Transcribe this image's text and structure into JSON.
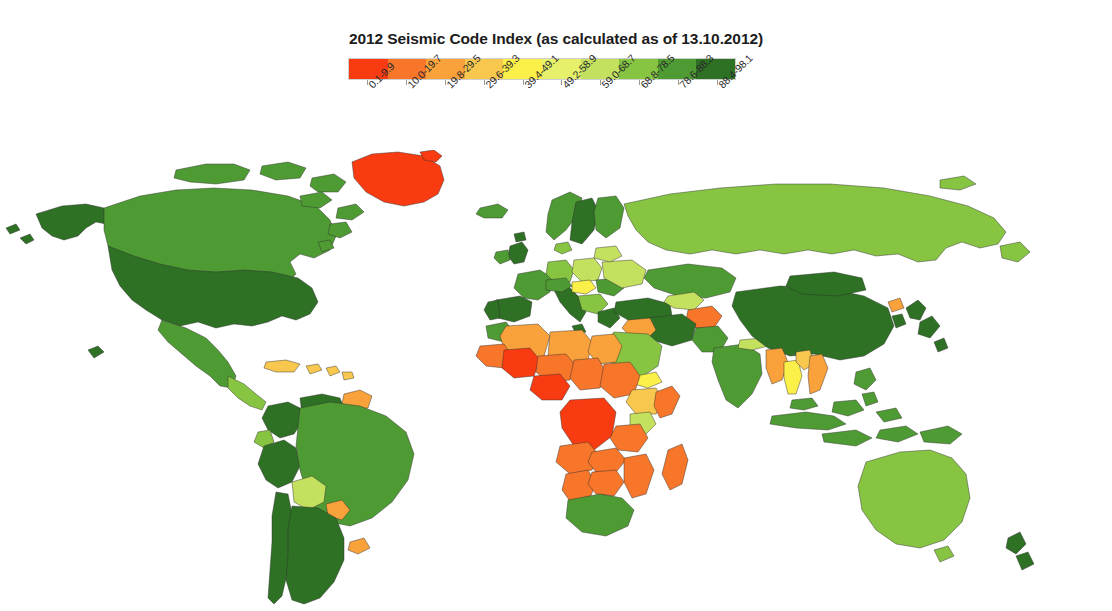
{
  "top_cutoff_text": "· · · · · · · · · · · · · · · · · · · · · · · · · · ·",
  "header": {
    "title": "2012 Seismic Code Index (as calculated as of 13.10.2012)"
  },
  "chart_data": {
    "type": "map",
    "subtype": "choropleth",
    "title": "2012 Seismic Code Index (as calculated as of 13.10.2012)",
    "xlabel": "",
    "ylabel": "",
    "grid": false,
    "legend_position": "top-center",
    "legend_orientation": "horizontal",
    "value_name": "Seismic Code Index",
    "value_range": [
      0.1,
      98.1
    ],
    "projection": "equirectangular-like world map",
    "bins": [
      {
        "label": "0.1-9.9",
        "min": 0.1,
        "max": 9.9,
        "color": "#f93b12"
      },
      {
        "label": "10.0-19.7",
        "min": 10.0,
        "max": 19.7,
        "color": "#f7762a"
      },
      {
        "label": "19.8-29.5",
        "min": 19.8,
        "max": 29.5,
        "color": "#f9a13a"
      },
      {
        "label": "29.6-39.3",
        "min": 29.6,
        "max": 39.3,
        "color": "#f8c84e"
      },
      {
        "label": "39.4-49.1",
        "min": 39.4,
        "max": 49.1,
        "color": "#fbef4a"
      },
      {
        "label": "49.2-58.9",
        "min": 49.2,
        "max": 58.9,
        "color": "#e6f06a"
      },
      {
        "label": "59.0-68.7",
        "min": 59.0,
        "max": 68.7,
        "color": "#c3e05e"
      },
      {
        "label": "68.8-78.5",
        "min": 68.8,
        "max": 78.5,
        "color": "#86c442"
      },
      {
        "label": "78.6-88.3",
        "min": 78.6,
        "max": 88.3,
        "color": "#4f9b33"
      },
      {
        "label": "88.4-98.1",
        "min": 88.4,
        "max": 98.1,
        "color": "#2e7024"
      }
    ],
    "regions": [
      {
        "name": "United States of America",
        "bin": "88.4-98.1",
        "color": "#2e7024"
      },
      {
        "name": "Canada",
        "bin": "78.6-88.3",
        "color": "#4f9b33"
      },
      {
        "name": "Alaska (USA)",
        "bin": "88.4-98.1",
        "color": "#2e7024"
      },
      {
        "name": "Greenland",
        "bin": "0.1-9.9",
        "color": "#f93b12"
      },
      {
        "name": "Mexico",
        "bin": "78.6-88.3",
        "color": "#4f9b33"
      },
      {
        "name": "Central America",
        "bin": "68.8-78.5",
        "color": "#86c442"
      },
      {
        "name": "Caribbean",
        "bin": "29.6-39.3",
        "color": "#f8c84e"
      },
      {
        "name": "Colombia",
        "bin": "88.4-98.1",
        "color": "#2e7024"
      },
      {
        "name": "Venezuela",
        "bin": "88.4-98.1",
        "color": "#2e7024"
      },
      {
        "name": "Guyana / Suriname",
        "bin": "19.8-29.5",
        "color": "#f9a13a"
      },
      {
        "name": "Ecuador",
        "bin": "68.8-78.5",
        "color": "#86c442"
      },
      {
        "name": "Peru",
        "bin": "88.4-98.1",
        "color": "#2e7024"
      },
      {
        "name": "Brazil",
        "bin": "78.6-88.3",
        "color": "#4f9b33"
      },
      {
        "name": "Bolivia",
        "bin": "59.0-68.7",
        "color": "#c3e05e"
      },
      {
        "name": "Paraguay",
        "bin": "19.8-29.5",
        "color": "#f9a13a"
      },
      {
        "name": "Uruguay",
        "bin": "19.8-29.5",
        "color": "#f9a13a"
      },
      {
        "name": "Chile",
        "bin": "88.4-98.1",
        "color": "#2e7024"
      },
      {
        "name": "Argentina",
        "bin": "88.4-98.1",
        "color": "#2e7024"
      },
      {
        "name": "Iceland",
        "bin": "78.6-88.3",
        "color": "#4f9b33"
      },
      {
        "name": "United Kingdom",
        "bin": "88.4-98.1",
        "color": "#2e7024"
      },
      {
        "name": "Ireland",
        "bin": "78.6-88.3",
        "color": "#4f9b33"
      },
      {
        "name": "Norway",
        "bin": "78.6-88.3",
        "color": "#4f9b33"
      },
      {
        "name": "Sweden",
        "bin": "88.4-98.1",
        "color": "#2e7024"
      },
      {
        "name": "Finland",
        "bin": "78.6-88.3",
        "color": "#4f9b33"
      },
      {
        "name": "Denmark",
        "bin": "68.8-78.5",
        "color": "#86c442"
      },
      {
        "name": "France",
        "bin": "78.6-88.3",
        "color": "#4f9b33"
      },
      {
        "name": "Spain",
        "bin": "88.4-98.1",
        "color": "#2e7024"
      },
      {
        "name": "Portugal",
        "bin": "88.4-98.1",
        "color": "#2e7024"
      },
      {
        "name": "Germany",
        "bin": "68.8-78.5",
        "color": "#86c442"
      },
      {
        "name": "Poland",
        "bin": "59.0-68.7",
        "color": "#c3e05e"
      },
      {
        "name": "Italy",
        "bin": "88.4-98.1",
        "color": "#2e7024"
      },
      {
        "name": "Austria / Switzerland",
        "bin": "78.6-88.3",
        "color": "#4f9b33"
      },
      {
        "name": "Hungary",
        "bin": "39.4-49.1",
        "color": "#fbef4a"
      },
      {
        "name": "Romania",
        "bin": "78.6-88.3",
        "color": "#4f9b33"
      },
      {
        "name": "Balkans",
        "bin": "68.8-78.5",
        "color": "#86c442"
      },
      {
        "name": "Greece",
        "bin": "88.4-98.1",
        "color": "#2e7024"
      },
      {
        "name": "Ukraine",
        "bin": "59.0-68.7",
        "color": "#c3e05e"
      },
      {
        "name": "Belarus",
        "bin": "59.0-68.7",
        "color": "#c3e05e"
      },
      {
        "name": "Turkey",
        "bin": "88.4-98.1",
        "color": "#2e7024"
      },
      {
        "name": "Russia",
        "bin": "68.8-78.5",
        "color": "#86c442"
      },
      {
        "name": "Kazakhstan",
        "bin": "78.6-88.3",
        "color": "#4f9b33"
      },
      {
        "name": "Uzbekistan",
        "bin": "59.0-68.7",
        "color": "#c3e05e"
      },
      {
        "name": "Afghanistan",
        "bin": "10.0-19.7",
        "color": "#f7762a"
      },
      {
        "name": "Iran",
        "bin": "88.4-98.1",
        "color": "#2e7024"
      },
      {
        "name": "Iraq",
        "bin": "19.8-29.5",
        "color": "#f9a13a"
      },
      {
        "name": "Saudi Arabia",
        "bin": "68.8-78.5",
        "color": "#86c442"
      },
      {
        "name": "Yemen",
        "bin": "39.4-49.1",
        "color": "#fbef4a"
      },
      {
        "name": "Pakistan",
        "bin": "78.6-88.3",
        "color": "#4f9b33"
      },
      {
        "name": "India",
        "bin": "78.6-88.3",
        "color": "#4f9b33"
      },
      {
        "name": "Nepal",
        "bin": "59.0-68.7",
        "color": "#c3e05e"
      },
      {
        "name": "China",
        "bin": "88.4-98.1",
        "color": "#2e7024"
      },
      {
        "name": "Mongolia",
        "bin": "88.4-98.1",
        "color": "#2e7024"
      },
      {
        "name": "Japan",
        "bin": "88.4-98.1",
        "color": "#2e7024"
      },
      {
        "name": "South Korea",
        "bin": "88.4-98.1",
        "color": "#2e7024"
      },
      {
        "name": "North Korea",
        "bin": "19.8-29.5",
        "color": "#f9a13a"
      },
      {
        "name": "Myanmar",
        "bin": "19.8-29.5",
        "color": "#f9a13a"
      },
      {
        "name": "Thailand",
        "bin": "39.4-49.1",
        "color": "#fbef4a"
      },
      {
        "name": "Laos",
        "bin": "29.6-39.3",
        "color": "#f8c84e"
      },
      {
        "name": "Vietnam",
        "bin": "19.8-29.5",
        "color": "#f9a13a"
      },
      {
        "name": "Malaysia",
        "bin": "78.6-88.3",
        "color": "#4f9b33"
      },
      {
        "name": "Indonesia",
        "bin": "78.6-88.3",
        "color": "#4f9b33"
      },
      {
        "name": "Philippines",
        "bin": "78.6-88.3",
        "color": "#4f9b33"
      },
      {
        "name": "Papua New Guinea",
        "bin": "78.6-88.3",
        "color": "#4f9b33"
      },
      {
        "name": "Australia",
        "bin": "68.8-78.5",
        "color": "#86c442"
      },
      {
        "name": "New Zealand",
        "bin": "88.4-98.1",
        "color": "#2e7024"
      },
      {
        "name": "Morocco",
        "bin": "78.6-88.3",
        "color": "#4f9b33"
      },
      {
        "name": "Algeria",
        "bin": "19.8-29.5",
        "color": "#f9a13a"
      },
      {
        "name": "Libya",
        "bin": "19.8-29.5",
        "color": "#f9a13a"
      },
      {
        "name": "Egypt",
        "bin": "19.8-29.5",
        "color": "#f9a13a"
      },
      {
        "name": "Mauritania",
        "bin": "10.0-19.7",
        "color": "#f7762a"
      },
      {
        "name": "Mali",
        "bin": "0.1-9.9",
        "color": "#f93b12"
      },
      {
        "name": "Niger",
        "bin": "10.0-19.7",
        "color": "#f7762a"
      },
      {
        "name": "Chad",
        "bin": "10.0-19.7",
        "color": "#f7762a"
      },
      {
        "name": "Sudan",
        "bin": "10.0-19.7",
        "color": "#f7762a"
      },
      {
        "name": "Nigeria",
        "bin": "0.1-9.9",
        "color": "#f93b12"
      },
      {
        "name": "Ethiopia",
        "bin": "29.6-39.3",
        "color": "#f8c84e"
      },
      {
        "name": "Somalia",
        "bin": "10.0-19.7",
        "color": "#f7762a"
      },
      {
        "name": "Kenya",
        "bin": "59.0-68.7",
        "color": "#c3e05e"
      },
      {
        "name": "DR Congo",
        "bin": "0.1-9.9",
        "color": "#f93b12"
      },
      {
        "name": "Angola",
        "bin": "10.0-19.7",
        "color": "#f7762a"
      },
      {
        "name": "Tanzania",
        "bin": "10.0-19.7",
        "color": "#f7762a"
      },
      {
        "name": "Zambia",
        "bin": "10.0-19.7",
        "color": "#f7762a"
      },
      {
        "name": "Mozambique",
        "bin": "10.0-19.7",
        "color": "#f7762a"
      },
      {
        "name": "Madagascar",
        "bin": "10.0-19.7",
        "color": "#f7762a"
      },
      {
        "name": "South Africa",
        "bin": "78.6-88.3",
        "color": "#4f9b33"
      },
      {
        "name": "Namibia",
        "bin": "10.0-19.7",
        "color": "#f7762a"
      },
      {
        "name": "Botswana",
        "bin": "10.0-19.7",
        "color": "#f7762a"
      }
    ]
  },
  "map": {
    "ocean_color": "#ffffff",
    "border_color": "#2f2f2f"
  }
}
